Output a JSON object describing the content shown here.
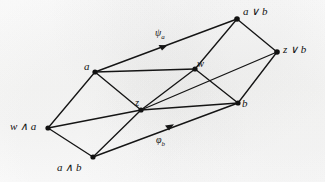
{
  "figure": {
    "kind": "lattice-hasse-diagram",
    "stroke_color": "#151515",
    "background_color": "#fdfdfc",
    "vertices": [
      {
        "id": "w_and_a",
        "label": "w ∧ a",
        "x": 48,
        "y": 128,
        "label_x": 10,
        "label_y": 121,
        "size": "big"
      },
      {
        "id": "a",
        "label": "a",
        "x": 95,
        "y": 72,
        "label_x": 84,
        "label_y": 62,
        "size": "big"
      },
      {
        "id": "a_and_b",
        "label": "a ∧ b",
        "x": 93,
        "y": 157,
        "label_x": 57,
        "label_y": 162,
        "size": "big"
      },
      {
        "id": "z",
        "label": "z",
        "x": 141,
        "y": 110,
        "label_x": 136,
        "label_y": 99,
        "size": "small"
      },
      {
        "id": "w",
        "label": "w",
        "x": 195,
        "y": 69,
        "label_x": 197,
        "label_y": 60,
        "size": "small"
      },
      {
        "id": "b",
        "label": "b",
        "x": 238,
        "y": 103,
        "label_x": 241,
        "label_y": 100,
        "size": "big"
      },
      {
        "id": "a_or_b",
        "label": "a ∨ b",
        "x": 237,
        "y": 19,
        "label_x": 242,
        "label_y": 7,
        "size": "big"
      },
      {
        "id": "z_or_b",
        "label": "z ∨ b",
        "x": 277,
        "y": 52,
        "label_x": 282,
        "label_y": 44,
        "size": "big"
      }
    ],
    "edges": [
      {
        "from": "w_and_a",
        "to": "a",
        "arrow": false
      },
      {
        "from": "w_and_a",
        "to": "a_and_b",
        "arrow": false
      },
      {
        "from": "w_and_a",
        "to": "z",
        "arrow": false
      },
      {
        "from": "a",
        "to": "z",
        "arrow": false
      },
      {
        "from": "a_and_b",
        "to": "z",
        "arrow": false
      },
      {
        "from": "a",
        "to": "a_or_b",
        "arrow": false
      },
      {
        "from": "a",
        "to": "w",
        "arrow": true
      },
      {
        "from": "a_and_b",
        "to": "b",
        "arrow": true
      },
      {
        "from": "z",
        "to": "w",
        "arrow": false
      },
      {
        "from": "z",
        "to": "b",
        "arrow": false
      },
      {
        "from": "w",
        "to": "a_or_b",
        "arrow": false
      },
      {
        "from": "w",
        "to": "b",
        "arrow": false
      },
      {
        "from": "b",
        "to": "z_or_b",
        "arrow": false
      },
      {
        "from": "a_or_b",
        "to": "z_or_b",
        "arrow": false
      },
      {
        "from": "z_or_b",
        "to": "z",
        "arrow": false
      }
    ],
    "arrow_labels": [
      {
        "id": "psi_a",
        "glyph": "ψ",
        "subscript": "a",
        "x": 156,
        "y": 29,
        "marker_x": 164,
        "marker_y": 47
      },
      {
        "id": "phi_b",
        "glyph": "φ",
        "subscript": "b",
        "x": 157,
        "y": 136,
        "marker_x": 170,
        "marker_y": 127
      }
    ]
  }
}
